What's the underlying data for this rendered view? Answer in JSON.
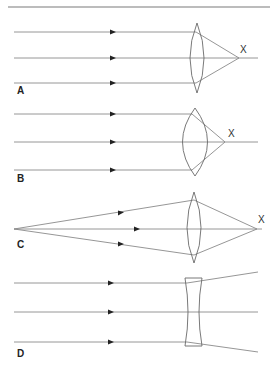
{
  "figure": {
    "panels": [
      {
        "id": "A",
        "label": "A",
        "focus_label": "X",
        "lens_type": "convex-thin",
        "description": "Parallel rays through thin converging lens focus at X"
      },
      {
        "id": "B",
        "label": "B",
        "focus_label": "X",
        "lens_type": "convex-thick",
        "description": "Parallel rays through thick converging lens focus closer at X"
      },
      {
        "id": "C",
        "label": "C",
        "focus_label": "X",
        "lens_type": "convex-thin",
        "description": "Diverging rays from near point source converge further away at X"
      },
      {
        "id": "D",
        "label": "D",
        "focus_label": "",
        "lens_type": "concave",
        "description": "Parallel rays through diverging lens spread out"
      }
    ],
    "colors": {
      "ray": "#8a8a8a",
      "lens": "#6a6a6a",
      "arrow": "#222222",
      "rule": "#7a7a7a"
    }
  }
}
